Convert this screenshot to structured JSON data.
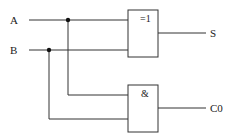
{
  "diagram": {
    "inputs": [
      {
        "label": "A"
      },
      {
        "label": "B"
      }
    ],
    "gates": [
      {
        "type": "XOR",
        "symbol": "=1",
        "output": "S"
      },
      {
        "type": "AND",
        "symbol": "&",
        "output": "C0"
      }
    ],
    "outputs": [
      {
        "label": "S"
      },
      {
        "label": "C0"
      }
    ],
    "colors": {
      "line": "#222222",
      "background": "#ffffff"
    }
  }
}
